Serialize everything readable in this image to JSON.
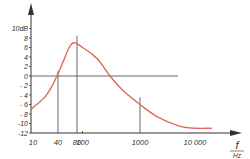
{
  "chart_data": {
    "type": "line",
    "title": "",
    "xlabel": "f",
    "xunit": "Hz",
    "ylabel": "",
    "yunit": "dB",
    "x_scale": "log",
    "xlim": [
      10,
      30000
    ],
    "ylim": [
      -12,
      10
    ],
    "y_ticks": [
      10,
      8,
      6,
      4,
      2,
      0,
      -2,
      -4,
      -6,
      -8,
      -10,
      -12
    ],
    "y_tick_labels": [
      "10dB",
      "8",
      "6",
      "4",
      "2",
      "0",
      "- 2",
      "- 4",
      "- 6",
      "- 8",
      "-10",
      "-12"
    ],
    "x_ticks": [
      10,
      40,
      80,
      100,
      1000,
      10000
    ],
    "x_tick_labels": [
      "10",
      "40",
      "80",
      "100",
      "1000",
      "10 000"
    ],
    "reference_lines": {
      "horizontal": [
        {
          "y": 0,
          "x_from": 10,
          "x_to": 20000
        }
      ],
      "vertical": [
        {
          "x": 40,
          "y_to": 1
        },
        {
          "x": 80,
          "y_to": 8.5
        },
        {
          "x": 1000,
          "y_to": -4.5
        }
      ]
    },
    "grid": false,
    "legend": null,
    "series": [
      {
        "name": "frequency response",
        "color": "#e06a5a",
        "x": [
          10,
          20,
          30,
          40,
          50,
          60,
          70,
          80,
          100,
          150,
          200,
          300,
          500,
          1000,
          2000,
          5000,
          10000,
          20000
        ],
        "y": [
          -7,
          -4.5,
          -2,
          0.5,
          3.5,
          6,
          7,
          6.8,
          6,
          4.5,
          3,
          0,
          -3,
          -6,
          -8.5,
          -10.5,
          -11,
          -11
        ]
      }
    ]
  },
  "colors": {
    "axis": "#333333",
    "curve": "#e06a5a",
    "background": "#ffffff"
  }
}
